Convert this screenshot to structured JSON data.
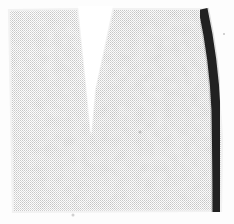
{
  "image": {
    "kind": "scanned-halftone-photograph",
    "width": 234,
    "height": 224,
    "caption": "",
    "background_color": "#ffffff",
    "paper_color": "#fdfdfd",
    "description": "Pale grey specimen, roughly rectangular, cleft at the top by a white V-shaped notch, bordered along the right edge by a thick dark curved band.",
    "halftone": {
      "enabled": true,
      "cell_px": 2,
      "pattern": "checkerboard-dot-screen",
      "dot_color": "#b8b8b8"
    }
  },
  "regions": {
    "left_lobe": {
      "label": "left lobe",
      "tone": "#dedede",
      "tone_light": "#eeeeee",
      "x": 10,
      "y": 9,
      "width": 72,
      "height": 203
    },
    "right_lobe": {
      "label": "right lobe",
      "tone": "#d4d4d4",
      "tone_light": "#e6e6e6",
      "x": 112,
      "y": 8,
      "width": 108,
      "height": 204
    },
    "notch": {
      "label": "V-shaped notch",
      "tone": "#ffffff",
      "top_left_x": 78,
      "top_right_x": 113,
      "top_y": 8,
      "apex_x": 91,
      "apex_y": 134,
      "top_width": 35
    },
    "dark_band": {
      "label": "dark marginal band",
      "tone": "#1b1b1b",
      "top_x": 203,
      "top_y": 9,
      "mid_x": 216,
      "mid_y": 110,
      "bottom_x": 217,
      "bottom_y": 212,
      "thickness": 9,
      "curved": true
    },
    "body": {
      "label": "specimen body",
      "top_y": 8,
      "bottom_y": 212,
      "left_x": 9,
      "right_x": 222
    }
  },
  "marks": [
    {
      "name": "speck-lower-centre",
      "x": 73,
      "y": 215,
      "size": 3
    },
    {
      "name": "speck-mid-right",
      "x": 140,
      "y": 132,
      "size": 3
    },
    {
      "name": "speck-upper-band",
      "x": 224,
      "y": 34,
      "size": 2
    }
  ],
  "colors": {
    "white": "#ffffff",
    "paper": "#fdfdfd",
    "grey_light": "#ececec",
    "grey_mid": "#d6d6d6",
    "grey_dark": "#c2c2c2",
    "black_band": "#1b1b1b"
  }
}
